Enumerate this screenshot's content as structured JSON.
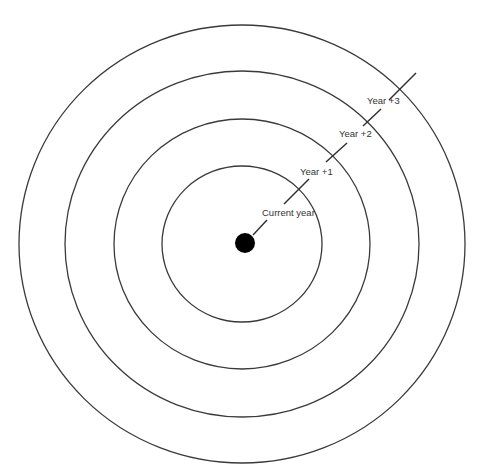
{
  "diagram": {
    "type": "concentric-rings-timeline",
    "center": {
      "x": 242,
      "y": 244
    },
    "center_dot": {
      "radius": 10,
      "color": "#000000"
    },
    "ring_color": "#3a3a3a",
    "label_color": "#333333",
    "rings": [
      {
        "name": "ring-current-year",
        "rx": 80,
        "ry": 78
      },
      {
        "name": "ring-year-plus-1",
        "rx": 128,
        "ry": 125
      },
      {
        "name": "ring-year-plus-2",
        "rx": 177,
        "ry": 173
      },
      {
        "name": "ring-year-plus-3",
        "rx": 223,
        "ry": 219
      }
    ],
    "labels": [
      {
        "text": "Current year",
        "x": 262,
        "y": 216
      },
      {
        "text": "Year +1",
        "x": 300,
        "y": 175
      },
      {
        "text": "Year +2",
        "x": 339,
        "y": 137
      },
      {
        "text": "Year +3",
        "x": 367,
        "y": 104
      }
    ],
    "ticks": [
      {
        "name": "dot-connector",
        "x1": 253,
        "y1": 235,
        "x2": 267,
        "y2": 220
      },
      {
        "name": "tick-current-year",
        "x1": 284,
        "y1": 204,
        "x2": 309,
        "y2": 179
      },
      {
        "name": "tick-year-plus-1",
        "x1": 326,
        "y1": 162,
        "x2": 347,
        "y2": 143
      },
      {
        "name": "tick-year-plus-2",
        "x1": 363,
        "y1": 126,
        "x2": 381,
        "y2": 109
      },
      {
        "name": "tick-year-plus-3",
        "x1": 389,
        "y1": 100,
        "x2": 416,
        "y2": 73
      }
    ]
  }
}
